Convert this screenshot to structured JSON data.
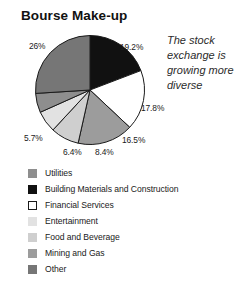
{
  "chart_data": {
    "type": "pie",
    "title": "Bourse Make-up",
    "caption": "The stock exchange is growing more diverse",
    "xlabel": "",
    "ylabel": "",
    "legend_position": "bottom-left",
    "start_angle_deg": 0,
    "direction": "clockwise",
    "categories": [
      "Building Materials and Construction",
      "Financial Services",
      "Mining and Gas",
      "Food and Beverage",
      "Entertainment",
      "Utilities",
      "Other"
    ],
    "values": [
      19.2,
      17.8,
      16.5,
      8.4,
      6.4,
      5.7,
      26
    ],
    "value_labels": [
      "19.2%",
      "17.8%",
      "16.5%",
      "8.4%",
      "6.4%",
      "5.7%",
      "26%"
    ],
    "colors": [
      "#111111",
      "#ffffff",
      "#9c9c9c",
      "#cfcfcf",
      "#e2e2e2",
      "#8e8e8e",
      "#767676"
    ],
    "slices": [
      {
        "label": "Building Materials and Construction",
        "value": 19.2,
        "display": "19.2%",
        "color": "#111111"
      },
      {
        "label": "Financial Services",
        "value": 17.8,
        "display": "17.8%",
        "color": "#ffffff"
      },
      {
        "label": "Mining and Gas",
        "value": 16.5,
        "display": "16.5%",
        "color": "#9c9c9c"
      },
      {
        "label": "Food and Beverage",
        "value": 8.4,
        "display": "8.4%",
        "color": "#cfcfcf"
      },
      {
        "label": "Entertainment",
        "value": 6.4,
        "display": "6.4%",
        "color": "#e2e2e2"
      },
      {
        "label": "Utilities",
        "value": 5.7,
        "display": "5.7%",
        "color": "#8e8e8e"
      },
      {
        "label": "Other",
        "value": 26,
        "display": "26%",
        "color": "#767676"
      }
    ]
  },
  "labels": {
    "p1": "19.2%",
    "p2": "17.8%",
    "p3": "16.5%",
    "p4": "8.4%",
    "p5": "6.4%",
    "p6": "5.7%",
    "p7": "26%"
  },
  "legend": {
    "items": [
      {
        "label": "Utilities",
        "color": "#8e8e8e",
        "outlined": false
      },
      {
        "label": "Building Materials and Construction",
        "color": "#111111",
        "outlined": false
      },
      {
        "label": "Financial Services",
        "color": "#ffffff",
        "outlined": true
      },
      {
        "label": "Entertainment",
        "color": "#e2e2e2",
        "outlined": false
      },
      {
        "label": "Food and Beverage",
        "color": "#cfcfcf",
        "outlined": false
      },
      {
        "label": "Mining and Gas",
        "color": "#9c9c9c",
        "outlined": false
      },
      {
        "label": "Other",
        "color": "#767676",
        "outlined": false
      }
    ]
  }
}
